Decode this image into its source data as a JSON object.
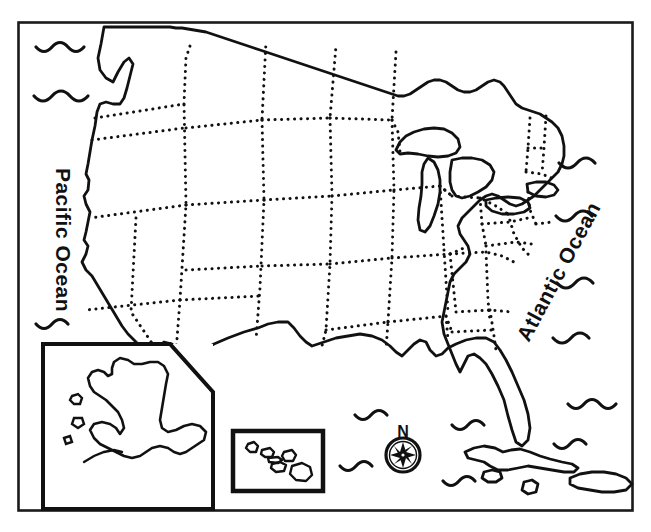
{
  "map": {
    "title": "Blank outline map of the United States",
    "frame": {
      "x": 18,
      "y": 22,
      "width": 615,
      "height": 489,
      "stroke_color": "#1a1a1a",
      "stroke_width": 2.5
    },
    "colors": {
      "ink": "#111111",
      "coastline": "#111111",
      "state_border": "#111111",
      "background": "#ffffff"
    },
    "labels": {
      "pacific_ocean": "Pacific Ocean",
      "atlantic_ocean": "Atlantic Ocean",
      "compass_north": "N"
    },
    "insets": [
      {
        "name": "alaska-inset",
        "x": 42,
        "y": 343,
        "width": 172,
        "height": 167
      },
      {
        "name": "hawaii-inset",
        "x": 232,
        "y": 430,
        "width": 92,
        "height": 62
      }
    ],
    "compass": {
      "name": "compass-rose",
      "cx": 403,
      "cy": 455,
      "radius": 17,
      "points": 8
    },
    "features": {
      "mainland": "contiguous-united-states",
      "great_lakes": [
        "Lake Superior",
        "Lake Michigan",
        "Lake Huron",
        "Lake Erie",
        "Lake Ontario"
      ],
      "state_borders_style": "dotted",
      "islands": [
        "Cuba",
        "Hispaniola",
        "Jamaica",
        "Bahamas"
      ],
      "wave_symbol_count": 13
    }
  }
}
